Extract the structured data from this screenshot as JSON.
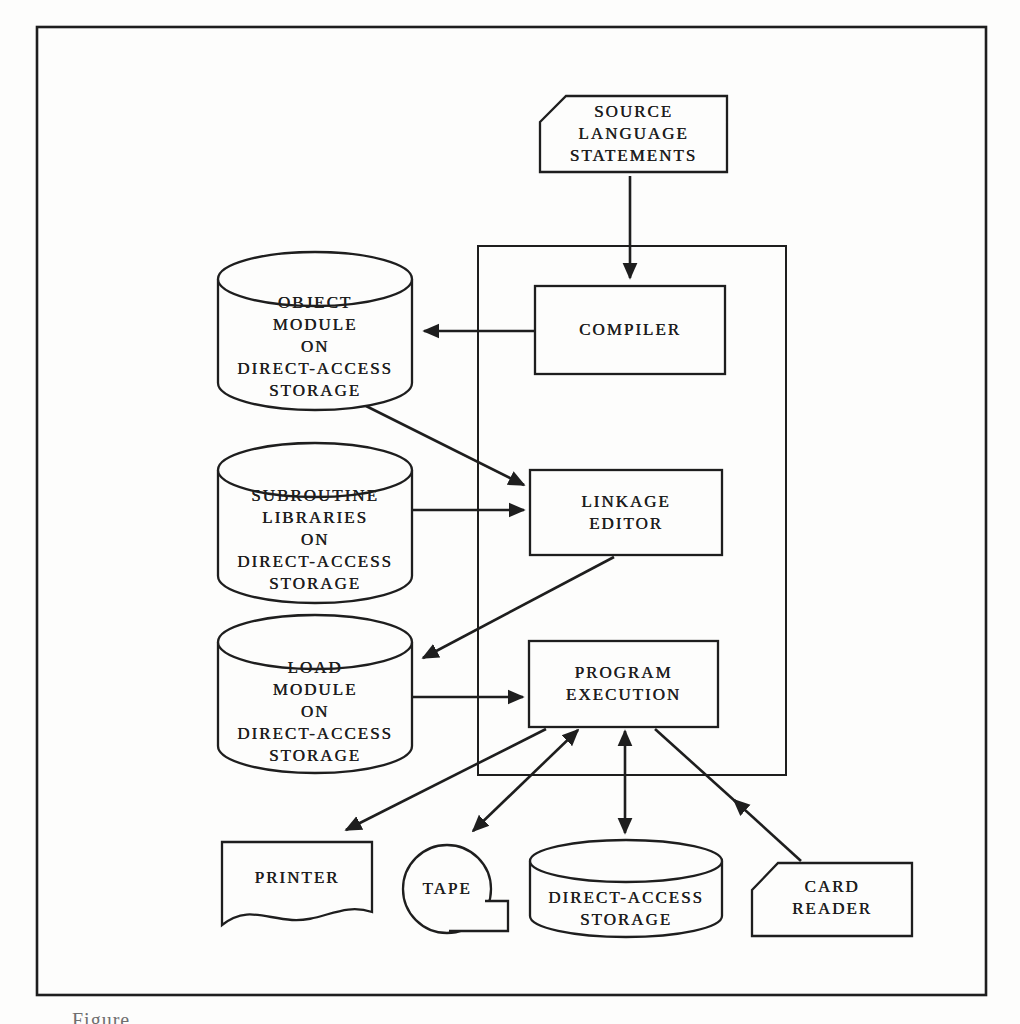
{
  "page": {
    "paper_color": "#fdfdfc",
    "ink_color": "#1e1e1e"
  },
  "diagram": {
    "nodes": {
      "source_card": {
        "shape": "punched-card",
        "label": "SOURCE\nLANGUAGE\nSTATEMENTS"
      },
      "compiler": {
        "shape": "process-box",
        "label": "COMPILER"
      },
      "object_module": {
        "shape": "direct-access-storage-drum",
        "label": "OBJECT\nMODULE\nON\nDIRECT-ACCESS\nSTORAGE"
      },
      "subroutine_libraries": {
        "shape": "direct-access-storage-drum",
        "label": "SUBROUTINE\nLIBRARIES\nON\nDIRECT-ACCESS\nSTORAGE"
      },
      "linkage_editor": {
        "shape": "process-box",
        "label": "LINKAGE\nEDITOR"
      },
      "load_module": {
        "shape": "direct-access-storage-drum",
        "label": "LOAD\nMODULE\nON\nDIRECT-ACCESS\nSTORAGE"
      },
      "program_execution": {
        "shape": "process-box",
        "label": "PROGRAM\nEXECUTION"
      },
      "printer": {
        "shape": "document",
        "label": "PRINTER"
      },
      "tape": {
        "shape": "magnetic-tape",
        "label": "TAPE"
      },
      "direct_access_storage": {
        "shape": "direct-access-storage-drum",
        "label": "DIRECT-ACCESS\nSTORAGE"
      },
      "card_reader": {
        "shape": "punched-card",
        "label": "CARD\nREADER"
      }
    },
    "edges": [
      {
        "from": "source_card",
        "to": "compiler",
        "direction": "one-way"
      },
      {
        "from": "compiler",
        "to": "object_module",
        "direction": "one-way"
      },
      {
        "from": "object_module",
        "to": "linkage_editor",
        "direction": "one-way"
      },
      {
        "from": "subroutine_libraries",
        "to": "linkage_editor",
        "direction": "one-way"
      },
      {
        "from": "linkage_editor",
        "to": "load_module",
        "direction": "one-way"
      },
      {
        "from": "load_module",
        "to": "program_execution",
        "direction": "one-way"
      },
      {
        "from": "program_execution",
        "to": "printer",
        "direction": "one-way"
      },
      {
        "from": "program_execution",
        "to": "tape",
        "direction": "two-way"
      },
      {
        "from": "program_execution",
        "to": "direct_access_storage",
        "direction": "two-way"
      },
      {
        "from": "card_reader",
        "to": "program_execution",
        "direction": "one-way"
      }
    ],
    "caption_partial": "Figure"
  }
}
